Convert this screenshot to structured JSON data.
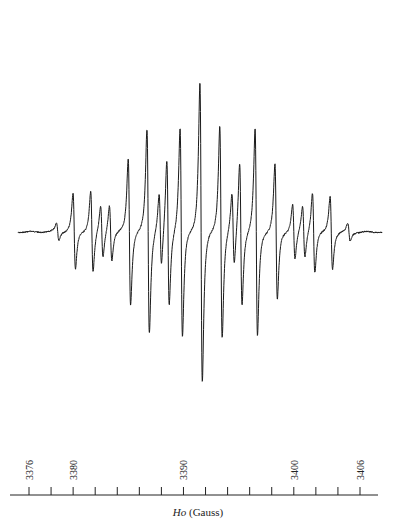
{
  "chart_data": {
    "type": "line",
    "title": "",
    "xlabel": "Ho (Gauss)",
    "xlabel_italic": "Ho",
    "xlabel_unit": "(Gauss)",
    "ylabel": "",
    "xlim": [
      3374.5,
      3408.5
    ],
    "tick_step": 2,
    "tick_labels": [
      "3376",
      "3380",
      "3390",
      "3400",
      "3406"
    ],
    "tick_label_values": [
      3376,
      3380,
      3390,
      3400,
      3406
    ],
    "grid": false,
    "baseline_y": 232,
    "lines": [
      {
        "x": 3378.6,
        "amp": 12
      },
      {
        "x": 3380.1,
        "amp": 52
      },
      {
        "x": 3381.7,
        "amp": 55
      },
      {
        "x": 3382.6,
        "amp": 35
      },
      {
        "x": 3383.4,
        "amp": 38
      },
      {
        "x": 3385.1,
        "amp": 100
      },
      {
        "x": 3386.8,
        "amp": 140
      },
      {
        "x": 3387.9,
        "amp": 50
      },
      {
        "x": 3388.6,
        "amp": 100
      },
      {
        "x": 3389.8,
        "amp": 143
      },
      {
        "x": 3391.6,
        "amp": 205
      },
      {
        "x": 3393.4,
        "amp": 145
      },
      {
        "x": 3394.5,
        "amp": 50
      },
      {
        "x": 3395.2,
        "amp": 98
      },
      {
        "x": 3396.6,
        "amp": 142
      },
      {
        "x": 3398.4,
        "amp": 93
      },
      {
        "x": 3400.0,
        "amp": 38
      },
      {
        "x": 3400.9,
        "amp": 35
      },
      {
        "x": 3401.8,
        "amp": 55
      },
      {
        "x": 3403.4,
        "amp": 50
      },
      {
        "x": 3405.0,
        "amp": 12
      }
    ]
  }
}
